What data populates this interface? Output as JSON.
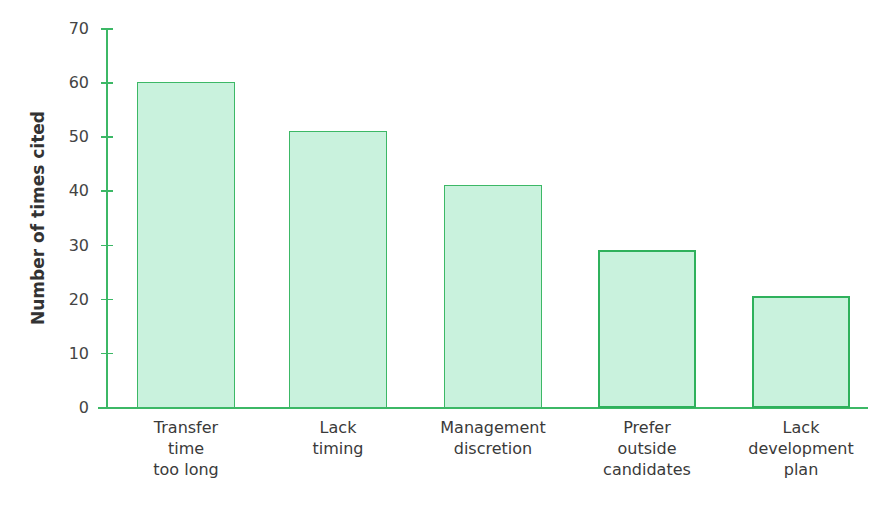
{
  "chart_data": {
    "type": "bar",
    "title": "",
    "xlabel": "",
    "ylabel": "Number of times cited",
    "ylim": [
      0,
      70
    ],
    "yticks": [
      0,
      10,
      20,
      30,
      40,
      50,
      60,
      70
    ],
    "grid": false,
    "legend": null,
    "categories": [
      "Transfer time too long",
      "Lack timing",
      "Management discretion",
      "Prefer outside candidates",
      "Lack development plan"
    ],
    "category_label_lines": [
      "Transfer\ntime\ntoo long",
      "Lack\ntiming",
      "Management\ndiscretion",
      "Prefer\noutside\ncandidates",
      "Lack\ndevelopment\nplan"
    ],
    "values": [
      60,
      51,
      41,
      29,
      20.5
    ],
    "colors": {
      "bar_fill": "#c9f2dd",
      "bar_border": "#3cb866",
      "axis": "#3cb866"
    }
  }
}
